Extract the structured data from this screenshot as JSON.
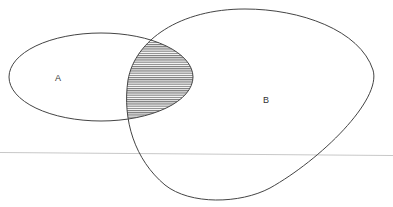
{
  "diagram": {
    "type": "venn",
    "sets": [
      {
        "id": "A",
        "label": "A"
      },
      {
        "id": "B",
        "label": "B"
      }
    ],
    "shaded_region": "A ∩ B",
    "shading_pattern": "horizontal-lines",
    "colors": {
      "outline": "#444444",
      "hatch": "#555555",
      "baseline": "#c8c8c8",
      "background": "#ffffff"
    }
  }
}
